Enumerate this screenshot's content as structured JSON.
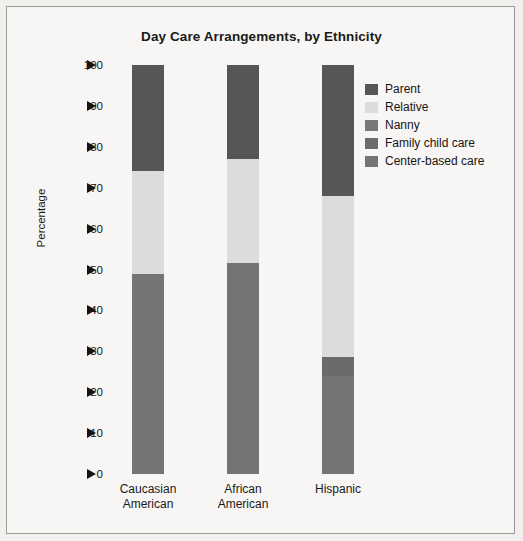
{
  "chart_data": {
    "type": "bar",
    "subtype": "stacked-bar-100",
    "title": "Day Care Arrangements, by Ethnicity",
    "xlabel": "",
    "ylabel": "Percentage",
    "ylim": [
      0,
      100
    ],
    "ytick_values": [
      0,
      10,
      20,
      30,
      40,
      50,
      60,
      70,
      80,
      90,
      100
    ],
    "ytick_labels": [
      "0",
      "10",
      "20",
      "30",
      "40",
      "50",
      "60",
      "70",
      "80",
      "90",
      "100"
    ],
    "grid": false,
    "legend_position": "top-right",
    "categories": [
      "Caucasian American",
      "African American",
      "Hispanic"
    ],
    "category_lines": [
      [
        "Caucasian",
        "American"
      ],
      [
        "African",
        "American"
      ],
      [
        "Hispanic"
      ]
    ],
    "series": [
      {
        "name": "Parent",
        "color": "#565656",
        "values": [
          26.0,
          23.0,
          32.0
        ]
      },
      {
        "name": "Relative",
        "color": "#dcdcdc",
        "values": [
          25.0,
          25.5,
          39.5
        ]
      },
      {
        "name": "Nanny",
        "color": "#787878",
        "values": [
          0,
          0,
          0
        ]
      },
      {
        "name": "Family child care",
        "color": "#6b6b6b",
        "values": [
          0,
          0,
          4.5
        ]
      },
      {
        "name": "Center-based care",
        "color": "#747474",
        "values": [
          49.0,
          51.5,
          24.0
        ]
      }
    ],
    "stack_order_bottom_to_top": [
      "Center-based care",
      "Family child care",
      "Nanny",
      "Relative",
      "Parent"
    ],
    "cumulative_boundaries": {
      "Caucasian American": [
        0,
        49.0,
        49.0,
        49.0,
        74.0,
        100.0
      ],
      "African American": [
        0,
        51.5,
        51.5,
        51.5,
        77.0,
        100.0
      ],
      "Hispanic": [
        0,
        24.0,
        28.5,
        28.5,
        68.0,
        100.0
      ]
    }
  },
  "legend": {
    "items": [
      {
        "label": "Parent",
        "color": "#565656"
      },
      {
        "label": "Relative",
        "color": "#dcdcdc"
      },
      {
        "label": "Nanny",
        "color": "#787878"
      },
      {
        "label": "Family child care",
        "color": "#6b6b6b"
      },
      {
        "label": "Center-based care",
        "color": "#747474"
      }
    ]
  },
  "colors": {
    "page_background": "#f1f0ee",
    "plot_background": "#f7f6f4",
    "frame_border": "#9a9a96",
    "text": "#1a1a1a"
  }
}
